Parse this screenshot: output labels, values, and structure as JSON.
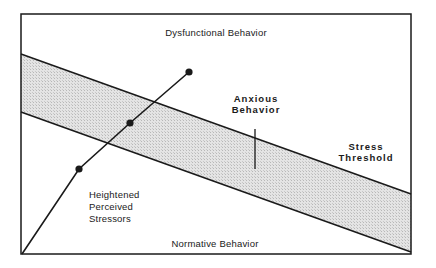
{
  "diagram": {
    "frame": {
      "left": 21,
      "top": 14,
      "right": 411,
      "bottom": 254
    },
    "colors": {
      "line": "#1a1a1a",
      "band_fill": "#d9d9d9",
      "background": "#ffffff"
    },
    "regions": {
      "top_label": "Dysfunctional Behavior",
      "bottom_label": "Normative Behavior"
    },
    "band": {
      "name": "Stress Threshold",
      "upper_line": {
        "x1": 21,
        "y1": 54,
        "x2": 411,
        "y2": 194
      },
      "lower_line": {
        "x1": 21,
        "y1": 112,
        "x2": 411,
        "y2": 252
      },
      "label_lines": [
        "Stress",
        "Threshold"
      ]
    },
    "stressor_line": {
      "name": "Heightened Perceived Stressors",
      "points": [
        [
          22,
          254
        ],
        [
          79,
          169
        ],
        [
          130,
          123
        ],
        [
          189,
          72
        ]
      ],
      "markers": [
        [
          79,
          169
        ],
        [
          130,
          123
        ],
        [
          189,
          72
        ]
      ],
      "label_lines": [
        "Heightened",
        "Perceived",
        "Stressors"
      ]
    },
    "anxious": {
      "label_lines": [
        "Anxious",
        "Behavior"
      ],
      "tick": {
        "x": 255,
        "y1": 129,
        "y2": 169
      }
    }
  }
}
